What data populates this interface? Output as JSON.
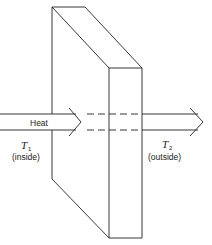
{
  "diagram": {
    "arrow_label": "Heat",
    "left": {
      "symbol": "T",
      "subscript": "1",
      "label": "(inside)"
    },
    "right": {
      "symbol": "T",
      "subscript": "2",
      "label": "(outside)"
    },
    "colors": {
      "stroke": "#222222",
      "background": "#ffffff"
    }
  }
}
